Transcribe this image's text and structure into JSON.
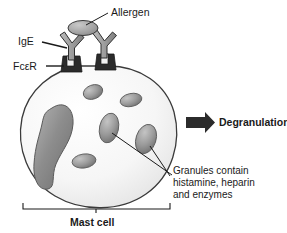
{
  "figure": {
    "title_implicit": "Mast cell degranulation diagram",
    "background_color": "#ffffff",
    "stroke_color": "#1a1a1a"
  },
  "labels": {
    "allergen": "Allergen",
    "ige": "IgE",
    "fcer": "FcεR",
    "degranulation": "Degranulation",
    "mast_cell": "Mast cell",
    "granules_line1": "Granules contain",
    "granules_line2": "histamine, heparin",
    "granules_line3": "and enzymes"
  },
  "colors": {
    "cell_fill": "#f7f7f7",
    "cell_stroke": "#3a3a3a",
    "nucleus_fill": "#8f8f8f",
    "nucleus_stroke": "#555555",
    "granule_fill": "#9a9a9a",
    "granule_stroke": "#5a5a5a",
    "allergen_fill": "#a8a8a8",
    "allergen_stroke": "#3a3a3a",
    "ige_fill": "#9e9e9e",
    "ige_stroke": "#3a3a3a",
    "receptor_fill": "#2b2b2b",
    "arrow_fill": "#2b2b2b",
    "text": "#1a1a1a"
  },
  "parts": {
    "allergen": {
      "name": "allergen-ellipse",
      "shape": "ellipse",
      "cx": 83,
      "cy": 28,
      "rx": 15,
      "ry": 7.5
    },
    "ige_antibodies": [
      {
        "name": "ige-antibody-left",
        "apex_x": 76,
        "apex_y": 58
      },
      {
        "name": "ige-antibody-right",
        "apex_x": 108,
        "apex_y": 58
      }
    ],
    "receptors": [
      {
        "name": "fcer-receptor-left",
        "x": 68,
        "y": 58
      },
      {
        "name": "fcer-receptor-right",
        "x": 100,
        "y": 58
      }
    ],
    "nucleus": {
      "name": "cell-nucleus",
      "shape": "kidney"
    },
    "granules": [
      {
        "name": "granule-top-left",
        "cx": 93,
        "cy": 92,
        "rx": 10,
        "ry": 7,
        "rot": -20
      },
      {
        "name": "granule-top-right",
        "cx": 131,
        "cy": 100,
        "rx": 11,
        "ry": 6.5,
        "rot": -12
      },
      {
        "name": "granule-center",
        "cx": 109,
        "cy": 128,
        "rx": 9.5,
        "ry": 15,
        "rot": 12
      },
      {
        "name": "granule-right",
        "cx": 146,
        "cy": 139,
        "rx": 10,
        "ry": 15,
        "rot": 18
      },
      {
        "name": "granule-bottom",
        "cx": 84,
        "cy": 161,
        "rx": 12,
        "ry": 7,
        "rot": -8
      }
    ],
    "degranulation_arrow": {
      "name": "degranulation-arrow",
      "x": 186,
      "y": 120,
      "width": 28,
      "height": 11
    },
    "mast_cell_bracket": {
      "name": "mast-cell-bracket",
      "left": 23,
      "right": 170,
      "y": 209
    }
  }
}
